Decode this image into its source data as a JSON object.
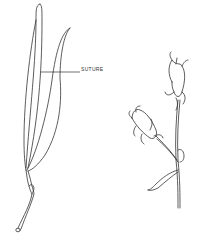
{
  "figure": {
    "labels": {
      "suture": "SUTURE"
    },
    "parts": [
      {
        "name": "seed-pod",
        "description": "elongated pod with two valves and a stalk"
      },
      {
        "name": "flowering-stem",
        "description": "stem with two buds and recurved sepals"
      }
    ],
    "colors": {
      "ink": "#333333",
      "background": "#ffffff"
    }
  }
}
